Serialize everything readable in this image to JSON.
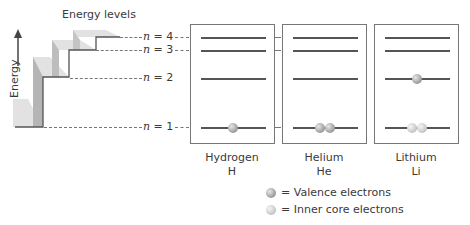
{
  "diagram": {
    "title": "Energy levels",
    "axis_label": "Energy",
    "levels": [
      {
        "n": "4",
        "label_prefix": "n",
        "label_rest": " = 4"
      },
      {
        "n": "3",
        "label_prefix": "n",
        "label_rest": " = 3"
      },
      {
        "n": "2",
        "label_prefix": "n",
        "label_rest": " = 2"
      },
      {
        "n": "1",
        "label_prefix": "n",
        "label_rest": " = 1"
      }
    ],
    "atoms": [
      {
        "name": "Hydrogen",
        "symbol": "H",
        "n1": [
          "valence"
        ],
        "n2": []
      },
      {
        "name": "Helium",
        "symbol": "He",
        "n1": [
          "valence",
          "valence"
        ],
        "n2": []
      },
      {
        "name": "Lithium",
        "symbol": "Li",
        "n1": [
          "core",
          "core"
        ],
        "n2": [
          "valence"
        ]
      }
    ],
    "legend": [
      {
        "type": "valence",
        "text": "= Valence electrons"
      },
      {
        "type": "core",
        "text": "= Inner core electrons"
      }
    ],
    "colors": {
      "line": "#555555",
      "box_border": "#777777",
      "stair_top": "#e2e2e2",
      "stair_face": "#b8b8b8",
      "valence": "#9a9a9a",
      "core": "#cfcfcf"
    }
  }
}
